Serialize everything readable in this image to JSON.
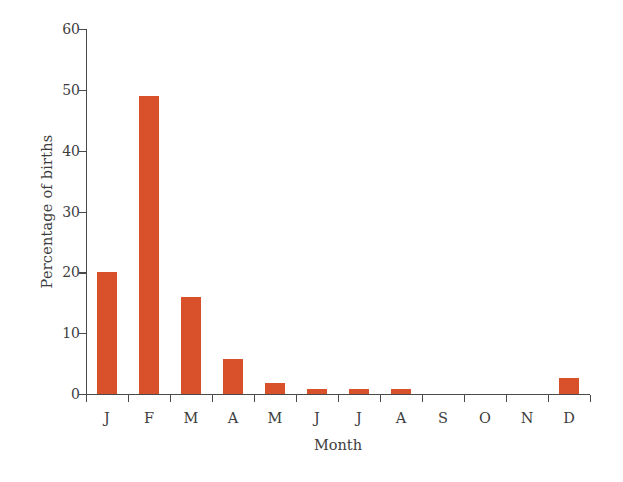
{
  "chart_data": {
    "type": "bar",
    "title": "",
    "xlabel": "Month",
    "ylabel": "Percentage of births",
    "categories": [
      "J",
      "F",
      "M",
      "A",
      "M",
      "J",
      "J",
      "A",
      "S",
      "O",
      "N",
      "D"
    ],
    "category_names": [
      "January",
      "February",
      "March",
      "April",
      "May",
      "June",
      "July",
      "August",
      "September",
      "October",
      "November",
      "December"
    ],
    "values": [
      20,
      49,
      16,
      5.7,
      1.8,
      0.9,
      0.9,
      0.9,
      0,
      0,
      0,
      2.7
    ],
    "ylim": [
      0,
      60
    ],
    "yticks": [
      0,
      10,
      20,
      30,
      40,
      50,
      60
    ],
    "ytick_labels": [
      "0",
      "10",
      "20",
      "30",
      "40",
      "50",
      "60"
    ],
    "grid": false,
    "legend": null,
    "bar_color": "#d9512b",
    "axis_color": "#4a4a4a",
    "text_color": "#3d3d3d",
    "background": "#ffffff"
  }
}
